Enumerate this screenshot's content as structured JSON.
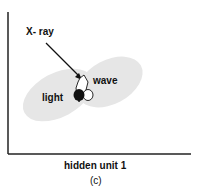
{
  "diagram": {
    "labels": {
      "xray": "X- ray",
      "wave": "wave",
      "light": "light"
    },
    "x_axis_label": "hidden unit 1",
    "panel_label": "(c)",
    "colors": {
      "cluster_fill": "#e6e6e6",
      "axis": "#222222",
      "light_marker": "#111111",
      "wave_marker": "#ffffff"
    }
  }
}
